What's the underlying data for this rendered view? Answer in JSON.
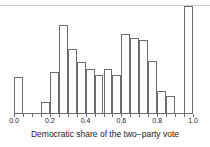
{
  "chart_data": {
    "type": "bar",
    "title": "",
    "xlabel": "Democratic share of the two−party vote",
    "ylabel": "",
    "xlim": [
      0.0,
      1.0
    ],
    "ylim": [
      0,
      107
    ],
    "grid": false,
    "legend": null,
    "bin_width": 0.05,
    "tick_labels": [
      "0.0",
      "0.2",
      "0.4",
      "0.6",
      "0.8",
      "1.0"
    ],
    "tick_values": [
      0.0,
      0.2,
      0.4,
      0.6,
      0.8,
      1.0
    ],
    "bin_edges": [
      0.0,
      0.05,
      0.1,
      0.15,
      0.2,
      0.25,
      0.3,
      0.35,
      0.4,
      0.45,
      0.5,
      0.55,
      0.6,
      0.65,
      0.7,
      0.75,
      0.8,
      0.85,
      0.9,
      0.95,
      1.0
    ],
    "categories": [
      "0.00-0.05",
      "0.05-0.10",
      "0.10-0.15",
      "0.15-0.20",
      "0.20-0.25",
      "0.25-0.30",
      "0.30-0.35",
      "0.35-0.40",
      "0.40-0.45",
      "0.45-0.50",
      "0.50-0.55",
      "0.55-0.60",
      "0.60-0.65",
      "0.65-0.70",
      "0.70-0.75",
      "0.75-0.80",
      "0.80-0.85",
      "0.85-0.90",
      "0.90-0.95",
      "0.95-1.00"
    ],
    "values": [
      36,
      0,
      0,
      11,
      41,
      88,
      64,
      51,
      44,
      38,
      44,
      38,
      79,
      75,
      73,
      52,
      22,
      17,
      0,
      107
    ]
  },
  "axis": {
    "x_title": "Democratic share of the two−party vote"
  }
}
